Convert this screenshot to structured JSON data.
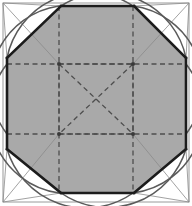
{
  "figure": {
    "type": "geometric-line-drawing",
    "background_color": "#ffffff",
    "canvas": {
      "width": 192,
      "height": 206
    }
  },
  "colors": {
    "fill_gray": "#a9a9a9",
    "octagon_stroke": "#1c1c1c",
    "thin_line": "#8a8a8a",
    "arc_stroke": "#5a5a5a",
    "dashed_stroke": "#4e4e4e",
    "outer_frame": "#9a9a9a",
    "node_fill": "#3a3a3a"
  },
  "strokes": {
    "octagon_width": 2.6,
    "thin_width": 0.8,
    "arc_width": 1.5,
    "dashed_width": 1.3,
    "outer_frame_width": 1.0,
    "dash_pattern": "5,3.5"
  },
  "outer_square": {
    "label": "outer-square",
    "x": 3,
    "y": 3,
    "width": 186,
    "height": 199
  },
  "octagon": {
    "label": "inscribed-octagon",
    "filled": true,
    "points": "61,6 134,6 186,58 186,149 134,193 61,193 7,149 7,58"
  },
  "corner_triangles": [
    {
      "name": "corner-triangle-top-left",
      "points": "3,3 61,6 7,58"
    },
    {
      "name": "corner-triangle-top-right",
      "points": "189,3 134,6 186,58"
    },
    {
      "name": "corner-triangle-bottom-right",
      "points": "189,202 186,149 134,193"
    },
    {
      "name": "corner-triangle-bottom-left",
      "points": "3,202 7,149 61,193"
    }
  ],
  "corner_diagonals": [
    {
      "name": "diagonal-top-left",
      "x1": 3,
      "y1": 3,
      "x2": 59,
      "y2": 64
    },
    {
      "name": "diagonal-top-right",
      "x1": 189,
      "y1": 3,
      "x2": 133,
      "y2": 64
    },
    {
      "name": "diagonal-bottom-right",
      "x1": 189,
      "y1": 202,
      "x2": 133,
      "y2": 134
    },
    {
      "name": "diagonal-bottom-left",
      "x1": 3,
      "y1": 202,
      "x2": 59,
      "y2": 134
    }
  ],
  "inner_dashed_square": {
    "label": "inner-dashed-square",
    "x": 59,
    "y": 64,
    "width": 74,
    "height": 70
  },
  "dashed_extensions": [
    {
      "name": "dashed-horizontal-upper",
      "x1": 7,
      "y1": 64,
      "x2": 186,
      "y2": 64
    },
    {
      "name": "dashed-horizontal-lower",
      "x1": 7,
      "y1": 134,
      "x2": 186,
      "y2": 134
    },
    {
      "name": "dashed-vertical-left",
      "x1": 59,
      "y1": 6,
      "x2": 59,
      "y2": 193
    },
    {
      "name": "dashed-vertical-right",
      "x1": 133,
      "y1": 6,
      "x2": 133,
      "y2": 193
    }
  ],
  "dashed_diagonals": [
    {
      "name": "dashed-diagonal-nw-se",
      "x1": 59,
      "y1": 64,
      "x2": 133,
      "y2": 134
    },
    {
      "name": "dashed-diagonal-ne-sw",
      "x1": 133,
      "y1": 64,
      "x2": 59,
      "y2": 134
    }
  ],
  "nodes": [
    {
      "name": "node-upper-left",
      "cx": 59,
      "cy": 64,
      "r": 2.0
    },
    {
      "name": "node-upper-right",
      "cx": 133,
      "cy": 64,
      "r": 2.0
    },
    {
      "name": "node-lower-left",
      "cx": 59,
      "cy": 134,
      "r": 2.0
    },
    {
      "name": "node-lower-right",
      "cx": 133,
      "cy": 134,
      "r": 2.0
    }
  ],
  "arcs": [
    {
      "name": "arc-centered-upper-left",
      "d": "M 59 6 A 80 80 0 0 0 7 134"
    },
    {
      "name": "arc-centered-upper-right",
      "d": "M 133 6 A 80 80 0 0 1 186 134"
    },
    {
      "name": "arc-centered-lower-left",
      "d": "M 59 193 A 80 80 0 0 1 7 64"
    },
    {
      "name": "arc-centered-lower-right",
      "d": "M 133 193 A 80 80 0 0 0 186 64"
    },
    {
      "name": "arc-top-left-to-right",
      "d": "M 7 58 A 82 82 0 0 1 133 6"
    },
    {
      "name": "arc-top-right-to-left",
      "d": "M 186 58 A 82 82 0 0 0 61 6"
    },
    {
      "name": "arc-bottom-left-to-right",
      "d": "M 7 149 A 82 82 0 0 0 133 193"
    },
    {
      "name": "arc-bottom-right-to-left",
      "d": "M 186 149 A 82 82 0 0 1 61 193"
    }
  ],
  "octagon_edge_lines": [
    {
      "name": "octagon-edge-top",
      "x1": 61,
      "y1": 6,
      "x2": 134,
      "y2": 6
    },
    {
      "name": "octagon-edge-top-right",
      "x1": 134,
      "y1": 6,
      "x2": 186,
      "y2": 58
    },
    {
      "name": "octagon-edge-right",
      "x1": 186,
      "y1": 58,
      "x2": 186,
      "y2": 149
    },
    {
      "name": "octagon-edge-bottom-right",
      "x1": 186,
      "y1": 149,
      "x2": 134,
      "y2": 193
    },
    {
      "name": "octagon-edge-bottom",
      "x1": 134,
      "y1": 193,
      "x2": 61,
      "y2": 193
    },
    {
      "name": "octagon-edge-bottom-left",
      "x1": 61,
      "y1": 193,
      "x2": 7,
      "y2": 149
    },
    {
      "name": "octagon-edge-left",
      "x1": 7,
      "y1": 149,
      "x2": 7,
      "y2": 58
    },
    {
      "name": "octagon-edge-top-left",
      "x1": 7,
      "y1": 58,
      "x2": 61,
      "y2": 6
    }
  ]
}
